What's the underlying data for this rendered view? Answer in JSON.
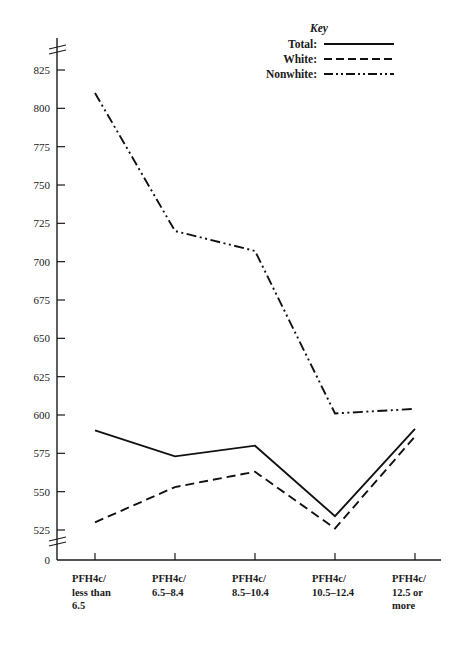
{
  "chart_data": {
    "type": "line",
    "title": "",
    "xlabel": "",
    "ylabel": "",
    "categories": [
      "PFH4c/\nless than\n6.5",
      "PFH4c/\n6.5–8.4",
      "PFH4c/\n8.5–10.4",
      "PFH4c/\n10.5–12.4",
      "PFH4c/\n12.5 or\nmore"
    ],
    "series": [
      {
        "name": "Total",
        "label": "Total:",
        "style": "solid",
        "values": [
          590,
          573,
          580,
          534,
          591
        ]
      },
      {
        "name": "White",
        "label": "White:",
        "style": "dashed",
        "values": [
          530,
          553,
          563,
          526,
          586
        ]
      },
      {
        "name": "Nonwhite",
        "label": "Nonwhite:",
        "style": "dash-dot-dot",
        "values": [
          810,
          720,
          707,
          601,
          604
        ]
      }
    ],
    "ylim": [
      525,
      835
    ],
    "y_ticks": [
      525,
      550,
      575,
      600,
      625,
      650,
      675,
      700,
      725,
      750,
      775,
      800,
      825
    ],
    "y_zero_label": "0",
    "axis_break": true,
    "grid": false,
    "legend_position": "top-right",
    "legend_title": "Key",
    "line_color": "#111111"
  },
  "axis": {
    "zero_label": "0"
  }
}
